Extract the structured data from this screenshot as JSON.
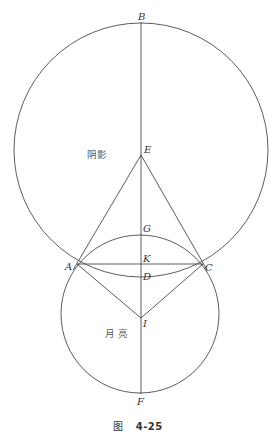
{
  "diagram": {
    "shadow_label": "阴影",
    "moon_label": "月 亮",
    "points": {
      "B": "B",
      "E": "E",
      "G": "G",
      "A": "A",
      "K": "K",
      "C": "C",
      "D": "D",
      "I": "I",
      "F": "F"
    },
    "colors": {
      "stroke": "#4a4a4a",
      "background": "#ffffff"
    }
  },
  "caption": {
    "figure_word": "图",
    "figure_number": "4-25"
  }
}
